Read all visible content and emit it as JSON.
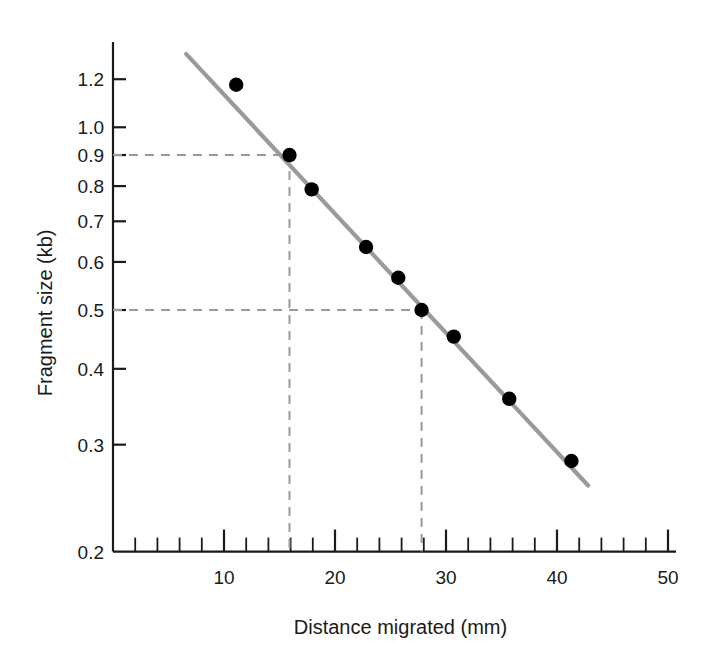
{
  "chart_data": {
    "type": "scatter",
    "title": "",
    "xlabel": "Distance migrated (mm)",
    "ylabel": "Fragment size (kb)",
    "xscale": "linear",
    "yscale": "log",
    "xlim": [
      0,
      50
    ],
    "ylim": [
      0.2,
      1.32
    ],
    "grid": false,
    "legend": null,
    "x": [
      11.1,
      15.9,
      17.9,
      22.8,
      25.7,
      27.8,
      30.7,
      35.7,
      41.3
    ],
    "y": [
      1.175,
      0.9,
      0.79,
      0.635,
      0.565,
      0.5,
      0.452,
      0.357,
      0.282
    ],
    "points": [
      {
        "x": 11.1,
        "y": 1.175
      },
      {
        "x": 15.9,
        "y": 0.9
      },
      {
        "x": 17.9,
        "y": 0.79
      },
      {
        "x": 22.8,
        "y": 0.635
      },
      {
        "x": 25.7,
        "y": 0.565
      },
      {
        "x": 27.8,
        "y": 0.5
      },
      {
        "x": 30.7,
        "y": 0.452
      },
      {
        "x": 35.7,
        "y": 0.357
      },
      {
        "x": 41.3,
        "y": 0.282
      }
    ],
    "fit_line": {
      "x0": 6.6,
      "y0": 1.32,
      "x1": 42.8,
      "y1": 0.257,
      "color": "#9a9a9a"
    },
    "guide_lines": [
      {
        "label": "0.9 kb guide",
        "x": 15.9,
        "y": 0.9
      },
      {
        "label": "0.5 kb guide",
        "x": 27.8,
        "y": 0.5
      }
    ],
    "xticks_major": [
      10,
      20,
      30,
      40,
      50
    ],
    "xticks_major_labels": [
      "10",
      "20",
      "30",
      "40",
      "50"
    ],
    "xticks_minor_step": 2,
    "yticks": [
      0.2,
      0.3,
      0.4,
      0.5,
      0.6,
      0.7,
      0.8,
      0.9,
      1.0,
      1.2
    ],
    "ytick_labels": [
      "0.2",
      "0.3",
      "0.4",
      "0.5",
      "0.6",
      "0.7",
      "0.8",
      "0.9",
      "1.0",
      "1.2"
    ],
    "marker_color": "#000000",
    "axis_color": "#1a1a1a",
    "guide_color": "#9a9a9a"
  },
  "axes": {
    "x_title": "Distance migrated (mm)",
    "y_title": "Fragment size (kb)"
  }
}
